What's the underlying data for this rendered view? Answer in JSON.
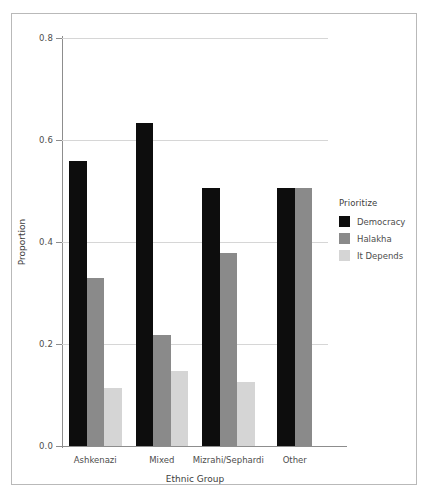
{
  "chart_data": {
    "type": "bar",
    "title": "",
    "subtitle": "",
    "xlabel": "Ethnic Group",
    "ylabel": "Proportion",
    "categories": [
      "Ashkenazi",
      "Mixed",
      "Mizrahi/Sephardi",
      "Other"
    ],
    "series": [
      {
        "name": "Democracy",
        "color": "#0d0d0d",
        "values": [
          0.558,
          0.634,
          0.505,
          0.505
        ]
      },
      {
        "name": "Halakha",
        "color": "#8a8a8a",
        "values": [
          0.33,
          0.218,
          0.378,
          0.505
        ]
      },
      {
        "name": "It Depends",
        "color": "#d5d5d5",
        "values": [
          0.113,
          0.148,
          0.125,
          null
        ]
      }
    ],
    "ylim": [
      0.0,
      0.8
    ],
    "yticks": [
      0.0,
      0.2,
      0.4,
      0.6,
      0.8
    ],
    "ytick_labels": [
      "0.0",
      "0.2",
      "0.4",
      "0.6",
      "0.8"
    ],
    "grid": true,
    "grid_axis": "y",
    "legend": {
      "title": "Prioritize",
      "position": "right",
      "entries": [
        "Democracy",
        "Halakha",
        "It Depends"
      ]
    },
    "bar_mode": "grouped"
  },
  "axes": {
    "y": {
      "title": "Proportion",
      "ticks": [
        {
          "value": 0.0,
          "label": "0.0"
        },
        {
          "value": 0.2,
          "label": "0.2"
        },
        {
          "value": 0.4,
          "label": "0.4"
        },
        {
          "value": 0.6,
          "label": "0.6"
        },
        {
          "value": 0.8,
          "label": "0.8"
        }
      ]
    },
    "x": {
      "title": "Ethnic Group",
      "categories": [
        {
          "label": "Ashkenazi"
        },
        {
          "label": "Mixed"
        },
        {
          "label": "Mizrahi/Sephardi"
        },
        {
          "label": "Other"
        }
      ]
    }
  },
  "legend": {
    "title": "Prioritize",
    "items": [
      {
        "label": "Democracy",
        "color": "#0d0d0d",
        "swatch": "legend-swatch-democracy"
      },
      {
        "label": "Halakha",
        "color": "#8a8a8a",
        "swatch": "legend-swatch-halakha"
      },
      {
        "label": "It Depends",
        "color": "#d5d5d5",
        "swatch": "legend-swatch-it-depends"
      }
    ]
  },
  "artifact": {
    "text": ""
  }
}
